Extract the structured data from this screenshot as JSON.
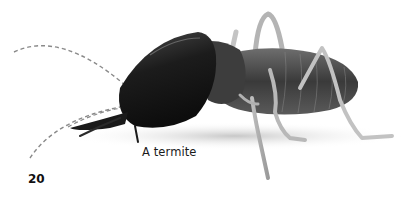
{
  "page": {
    "caption": "A termite",
    "page_number": "20"
  },
  "illustration": {
    "subject": "termite-photo",
    "style": "grayscale photograph with dashed-line antennae"
  }
}
